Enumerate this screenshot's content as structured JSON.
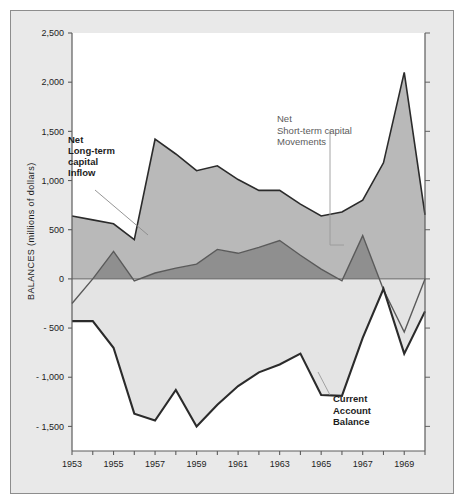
{
  "figure": {
    "background_color": "#e9e9e9",
    "plot_background_color": "#ffffff",
    "frame_border_color": "#8d8d8d"
  },
  "chart_data": {
    "type": "area",
    "title": "",
    "subtitle": "",
    "xlabel": "",
    "ylabel": "BALANCES (millions of dollars)",
    "xlim": [
      1953,
      1970
    ],
    "ylim": [
      -1750,
      2500
    ],
    "grid": false,
    "legend_position": "inline-annotations",
    "y_ticks": [
      2500,
      2000,
      1500,
      1000,
      500,
      0,
      -500,
      -1000,
      -1500
    ],
    "y_tick_labels": [
      "2,500",
      "2,000",
      "1,500",
      "1,000",
      "500",
      "0",
      "- 500",
      "- 1,000",
      "- 1,500"
    ],
    "x_ticks": [
      1953,
      1954,
      1955,
      1956,
      1957,
      1958,
      1959,
      1960,
      1961,
      1962,
      1963,
      1964,
      1965,
      1966,
      1967,
      1968,
      1969,
      1970
    ],
    "x_tick_labels_shown": [
      "1953",
      "1955",
      "1957",
      "1959",
      "1961",
      "1963",
      "1965",
      "1967",
      "1969"
    ],
    "x": [
      1953,
      1954,
      1955,
      1956,
      1957,
      1958,
      1959,
      1960,
      1961,
      1962,
      1963,
      1964,
      1965,
      1966,
      1967,
      1968,
      1969,
      1970
    ],
    "series": [
      {
        "name": "Net Long-term capital Inflow",
        "kind": "area-top",
        "color": "#b9b9b9",
        "line_color": "#2b2b2b",
        "values": [
          640,
          600,
          560,
          400,
          1420,
          1270,
          1100,
          1150,
          1010,
          900,
          900,
          760,
          640,
          680,
          800,
          1180,
          2100,
          650
        ]
      },
      {
        "name": "Net Short-term capital Movements",
        "kind": "area-bottom",
        "color": "#8f8f8f",
        "line_color": "#4a4a4a",
        "values": [
          -250,
          0,
          280,
          -20,
          60,
          110,
          150,
          300,
          260,
          320,
          390,
          240,
          100,
          -20,
          440,
          -110,
          -540,
          0
        ]
      },
      {
        "name": "Current Account Balance",
        "kind": "line",
        "color": "#2b2b2b",
        "line_color": "#2b2b2b",
        "values": [
          -430,
          -430,
          -700,
          -1370,
          -1440,
          -1130,
          -1500,
          -1280,
          -1090,
          -950,
          -870,
          -760,
          -1180,
          -1190,
          -600,
          -100,
          -760,
          -330
        ]
      }
    ],
    "annotations": [
      {
        "name": "net-long-term-capital-inflow",
        "text_lines": [
          "Net",
          "Long-term",
          "capital",
          "Inflow"
        ],
        "style": "bold-dark"
      },
      {
        "name": "net-short-term-capital-movements",
        "text_lines": [
          "Net",
          "Short-term capital",
          "Movements"
        ],
        "style": "gray"
      },
      {
        "name": "current-account-balance",
        "text_lines": [
          "Current",
          "Account",
          "Balance"
        ],
        "style": "bold-dark"
      }
    ]
  }
}
